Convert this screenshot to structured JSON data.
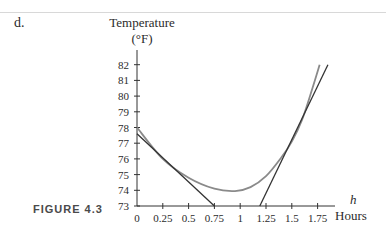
{
  "page": {
    "part_label": "d.",
    "figure_label": "FIGURE 4.3"
  },
  "chart_data": {
    "type": "line",
    "title": "",
    "ylabel_line1": "Temperature",
    "ylabel_line2": "(°F)",
    "xlabel_var": "h",
    "xlabel_unit": "Hours",
    "xlim": [
      0,
      1.85
    ],
    "ylim": [
      73,
      82
    ],
    "x_ticks": [
      0,
      0.25,
      0.5,
      0.75,
      1,
      1.25,
      1.5,
      1.75
    ],
    "x_tick_labels": [
      "0",
      "0.25",
      "0.5",
      "0.75",
      "1",
      "1.25",
      "1.5",
      "1.75"
    ],
    "y_ticks": [
      73,
      74,
      75,
      76,
      77,
      78,
      79,
      80,
      81,
      82
    ],
    "y_tick_labels": [
      "73",
      "74",
      "75",
      "76",
      "77",
      "78",
      "79",
      "80",
      "81",
      "82"
    ],
    "grid": false,
    "series": [
      {
        "name": "Temperature curve",
        "color": "#8a8a8a",
        "x": [
          0,
          0.25,
          0.5,
          0.75,
          0.95,
          1.1,
          1.25,
          1.4,
          1.5,
          1.6,
          1.7,
          1.77
        ],
        "y": [
          78.0,
          76.0,
          74.8,
          74.1,
          73.95,
          74.2,
          74.9,
          76.1,
          77.1,
          78.5,
          80.5,
          82.0
        ]
      },
      {
        "name": "Tangent line (left)",
        "color": "#333333",
        "x": [
          0,
          0.75
        ],
        "y": [
          77.6,
          73.0
        ]
      },
      {
        "name": "Tangent line (right)",
        "color": "#333333",
        "x": [
          1.19,
          1.85
        ],
        "y": [
          73.0,
          82.0
        ]
      }
    ]
  }
}
